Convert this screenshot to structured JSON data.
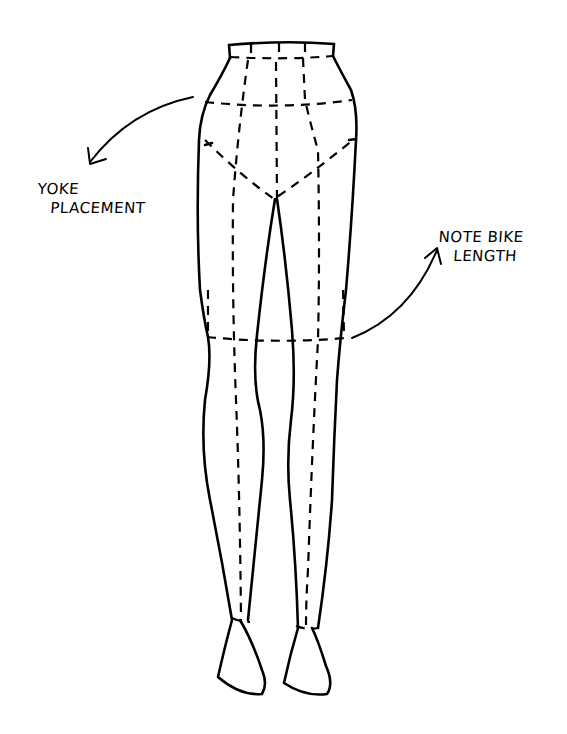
{
  "diagram": {
    "annotations": [
      {
        "id": "yoke",
        "lines": [
          "YOKE",
          "PLACEMENT"
        ]
      },
      {
        "id": "bike",
        "lines": [
          "NOTE BIKE",
          "LENGTH"
        ]
      }
    ],
    "colors": {
      "ink": "#000000",
      "paper": "#ffffff"
    }
  }
}
